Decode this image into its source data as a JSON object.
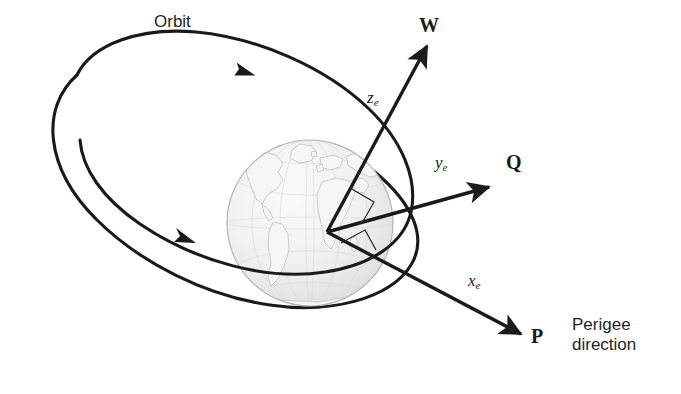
{
  "figure": {
    "background_color": "#ffffff",
    "line_color": "#1a1a1a",
    "globe_fill": "#f2f2f2",
    "globe_outline": "#b8b8b8",
    "continent_color": "#cfcfcf"
  },
  "labels": {
    "orbit": "Orbit",
    "w_vector": "W",
    "q_vector": "Q",
    "p_vector": "P",
    "z_axis": "z",
    "z_axis_sub": "e",
    "y_axis": "y",
    "y_axis_sub": "e",
    "x_axis": "x",
    "x_axis_sub": "e",
    "perigee_line1": "Perigee",
    "perigee_line2": "direction"
  },
  "geometry": {
    "origin_x": 327,
    "origin_y": 232,
    "globe_center_x": 310,
    "globe_center_y": 223,
    "globe_radius": 83,
    "w_tip_x": 427,
    "w_tip_y": 44,
    "q_tip_x": 492,
    "q_tip_y": 188,
    "p_tip_x": 524,
    "p_tip_y": 336,
    "orbit_cx": 222,
    "orbit_cy": 172,
    "orbit_rx": 196,
    "orbit_ry": 95,
    "orbit_rotation_deg": 31
  }
}
